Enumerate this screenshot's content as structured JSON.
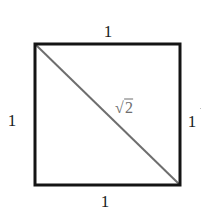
{
  "diagram": {
    "title": "",
    "shape": "square",
    "square": {
      "x1": 35,
      "y1": 44,
      "x2": 180,
      "y2": 185,
      "stroke": "#141414",
      "stroke_width": 3
    },
    "diagonal": {
      "from": "top-left",
      "to": "bottom-right",
      "stroke": "#6e6e6e",
      "stroke_width": 2
    },
    "labels": {
      "top": "1",
      "bottom": "1",
      "left": "1",
      "right": "1",
      "diagonal_symbol": "√",
      "diagonal_value": "2"
    },
    "colors": {
      "edge": "#141414",
      "diagonal": "#6e6e6e",
      "text": "#1a1a1a",
      "diagonal_text": "#6e6e6e"
    }
  }
}
